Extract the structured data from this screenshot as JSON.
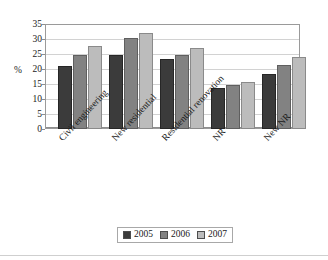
{
  "chart_data": {
    "type": "bar",
    "title": "",
    "xlabel": "",
    "ylabel": "%",
    "ylim": [
      0,
      35
    ],
    "yticks": [
      0,
      5,
      10,
      15,
      20,
      25,
      30,
      35
    ],
    "grid": true,
    "legend_position": "bottom",
    "categories": [
      "Civil engineering",
      "New residential",
      "Residential renovation",
      "NR",
      "New NR"
    ],
    "series": [
      {
        "name": "2005",
        "color": "#3b3b3b",
        "values": [
          21.1,
          24.7,
          23.2,
          13.6,
          18.3
        ]
      },
      {
        "name": "2006",
        "color": "#828282",
        "values": [
          24.6,
          30.4,
          24.8,
          14.6,
          21.3
        ]
      },
      {
        "name": "2007",
        "color": "#bcbcbc",
        "values": [
          27.6,
          32.1,
          26.9,
          15.7,
          24.0
        ]
      }
    ]
  }
}
